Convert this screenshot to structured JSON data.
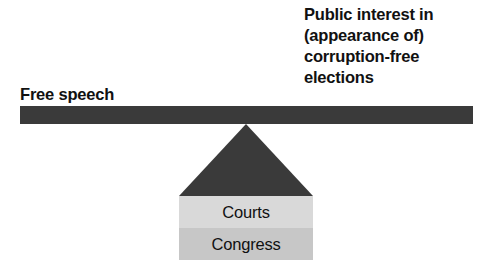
{
  "diagram": {
    "type": "balance-scale",
    "beam": {
      "color": "#3a3a3a",
      "tilt": "level"
    },
    "fulcrum": {
      "shape": "triangle",
      "color": "#3a3a3a"
    },
    "left_pan": {
      "label": "Free speech"
    },
    "right_pan": {
      "label": "Public interest in\n(appearance of)\ncorruption-free\nelections",
      "lines": [
        "Public interest in",
        "(appearance of)",
        "corruption-free",
        "elections"
      ]
    },
    "base_blocks": [
      {
        "label": "Courts",
        "color": "#d9d9d9"
      },
      {
        "label": "Congress",
        "color": "#c7c7c7"
      }
    ]
  }
}
